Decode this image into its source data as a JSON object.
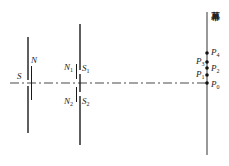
{
  "diagram": {
    "type": "optics-double-slit-interference",
    "colors": {
      "line": "#1a1a1a",
      "axis": "#333333",
      "screen": "#555555",
      "dot": "#111111"
    },
    "screen": {
      "label": "幕"
    },
    "single_slit": {
      "slit_label": "S",
      "edge_label": "N"
    },
    "double_slit": {
      "upper_edge_label": "N",
      "upper_edge_sub": "1",
      "upper_slit_label": "S",
      "upper_slit_sub": "1",
      "lower_edge_label": "N",
      "lower_edge_sub": "2",
      "lower_slit_label": "S",
      "lower_slit_sub": "2"
    },
    "points": [
      {
        "id": "P4",
        "label": "P",
        "sub": "4",
        "side": "right",
        "y": 53
      },
      {
        "id": "P3",
        "label": "P",
        "sub": "3",
        "side": "left",
        "y": 62
      },
      {
        "id": "P2",
        "label": "P",
        "sub": "2",
        "side": "right",
        "y": 68
      },
      {
        "id": "P1",
        "label": "P",
        "sub": "1",
        "side": "left",
        "y": 75
      },
      {
        "id": "P0",
        "label": "P",
        "sub": "0",
        "side": "right",
        "y": 83
      }
    ]
  }
}
